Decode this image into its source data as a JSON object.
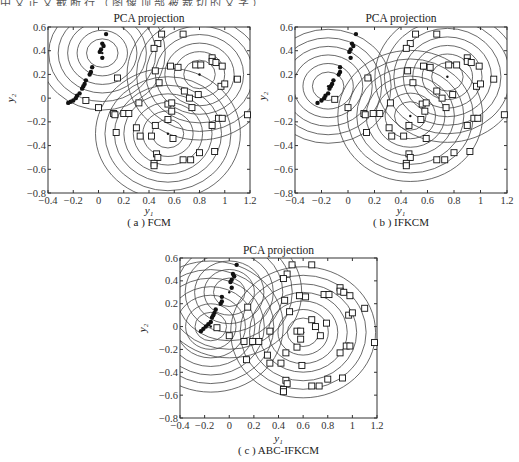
{
  "header_fragment": "中文正文截断行（图像顶部被裁切的文字）",
  "chart_data": [
    {
      "type": "scatter",
      "panel": "a",
      "title": "PCA projection",
      "caption": "( a ) FCM",
      "xlabel": "y1",
      "ylabel": "y2",
      "xlim": [
        -0.4,
        1.2
      ],
      "ylim": [
        -0.8,
        0.6
      ],
      "xticks": [
        "-0.4",
        "-0.2",
        "0",
        "0.2",
        "0.4",
        "0.6",
        "0.8",
        "1",
        "1.2"
      ],
      "yticks": [
        "0.6",
        "0.4",
        "0.2",
        "0",
        "-0.2",
        "-0.4",
        "-0.6",
        "-0.8"
      ],
      "grid": false,
      "contours": true,
      "cluster_centers": [
        [
          0.03,
          0.38
        ],
        [
          0.8,
          0.2
        ],
        [
          0.55,
          -0.3
        ]
      ],
      "series": [
        {
          "name": "class-1 (dots)",
          "marker": "filled-circle",
          "points": [
            [
              0.06,
              0.54
            ],
            [
              0.03,
              0.46
            ],
            [
              0.04,
              0.44
            ],
            [
              0.02,
              0.41
            ],
            [
              0.01,
              0.39
            ],
            [
              0.03,
              0.34
            ],
            [
              -0.05,
              0.26
            ],
            [
              -0.06,
              0.22
            ],
            [
              -0.07,
              0.2
            ],
            [
              -0.1,
              0.15
            ],
            [
              -0.11,
              0.12
            ],
            [
              -0.12,
              0.1
            ],
            [
              -0.13,
              0.08
            ],
            [
              -0.15,
              0.04
            ],
            [
              -0.17,
              0.02
            ],
            [
              -0.18,
              0.0
            ],
            [
              -0.2,
              -0.02
            ],
            [
              -0.22,
              -0.03
            ],
            [
              -0.24,
              -0.04
            ]
          ]
        },
        {
          "name": "class-2 (squares)",
          "marker": "open-square",
          "points": [
            [
              0.5,
              0.54
            ],
            [
              0.67,
              0.54
            ],
            [
              0.47,
              0.46
            ],
            [
              0.44,
              0.42
            ],
            [
              0.15,
              0.17
            ],
            [
              0.45,
              0.23
            ],
            [
              0.57,
              0.27
            ],
            [
              0.63,
              0.26
            ],
            [
              0.77,
              0.28
            ],
            [
              0.81,
              0.28
            ],
            [
              0.9,
              0.34
            ],
            [
              0.9,
              0.31
            ],
            [
              0.93,
              0.3
            ],
            [
              0.98,
              0.27
            ],
            [
              0.97,
              0.1
            ],
            [
              1.0,
              0.12
            ],
            [
              1.1,
              0.16
            ],
            [
              0.48,
              0.13
            ],
            [
              0.68,
              0.06
            ],
            [
              0.79,
              0.03
            ],
            [
              0.72,
              0.0
            ],
            [
              -0.1,
              -0.02
            ],
            [
              0.0,
              -0.08
            ],
            [
              0.32,
              -0.04
            ],
            [
              0.55,
              -0.05
            ],
            [
              0.58,
              -0.04
            ],
            [
              0.74,
              -0.08
            ],
            [
              0.12,
              -0.13
            ],
            [
              0.13,
              -0.14
            ],
            [
              0.2,
              -0.13
            ],
            [
              0.24,
              -0.13
            ],
            [
              0.58,
              -0.11
            ],
            [
              0.95,
              -0.17
            ],
            [
              0.98,
              -0.17
            ],
            [
              1.18,
              -0.14
            ],
            [
              0.55,
              -0.18
            ],
            [
              0.45,
              -0.23
            ],
            [
              0.9,
              -0.23
            ],
            [
              0.3,
              -0.25
            ],
            [
              0.14,
              -0.29
            ],
            [
              0.33,
              -0.32
            ],
            [
              0.42,
              -0.32
            ],
            [
              0.59,
              -0.34
            ],
            [
              0.8,
              -0.46
            ],
            [
              0.92,
              -0.45
            ],
            [
              0.46,
              -0.47
            ],
            [
              0.47,
              -0.5
            ],
            [
              0.67,
              -0.52
            ],
            [
              0.73,
              -0.52
            ],
            [
              0.44,
              -0.55
            ],
            [
              0.44,
              -0.57
            ]
          ]
        }
      ]
    },
    {
      "type": "scatter",
      "panel": "b",
      "title": "PCA projection",
      "caption": "( b ) IFKCM",
      "xlabel": "y1",
      "ylabel": "y2",
      "xlim": [
        -0.4,
        1.2
      ],
      "ylim": [
        -0.8,
        0.6
      ],
      "xticks": [
        "-0.4",
        "-0.2",
        "0",
        "0.2",
        "0.4",
        "0.6",
        "0.8",
        "1",
        "1.2"
      ],
      "yticks": [
        "0.6",
        "0.4",
        "0.2",
        "0",
        "-0.2",
        "-0.4",
        "-0.6",
        "-0.8"
      ],
      "grid": false,
      "contours": true,
      "cluster_centers": [
        [
          -0.15,
          0.1
        ],
        [
          0.75,
          0.18
        ],
        [
          0.47,
          -0.15
        ]
      ],
      "series": [
        {
          "name": "class-1 (dots)",
          "marker": "filled-circle",
          "points": [
            [
              0.06,
              0.54
            ],
            [
              0.03,
              0.46
            ],
            [
              0.04,
              0.44
            ],
            [
              0.02,
              0.41
            ],
            [
              0.01,
              0.39
            ],
            [
              0.02,
              0.34
            ],
            [
              -0.06,
              0.26
            ],
            [
              -0.06,
              0.22
            ],
            [
              -0.07,
              0.2
            ],
            [
              -0.11,
              0.15
            ],
            [
              -0.12,
              0.12
            ],
            [
              -0.13,
              0.1
            ],
            [
              -0.14,
              0.08
            ],
            [
              -0.15,
              0.04
            ],
            [
              -0.17,
              0.02
            ],
            [
              -0.18,
              0.0
            ],
            [
              -0.2,
              -0.02
            ],
            [
              -0.23,
              -0.04
            ]
          ]
        },
        {
          "name": "class-2 (squares)",
          "marker": "open-square",
          "points": [
            [
              0.51,
              0.54
            ],
            [
              0.67,
              0.54
            ],
            [
              0.47,
              0.46
            ],
            [
              0.44,
              0.42
            ],
            [
              0.15,
              0.17
            ],
            [
              0.45,
              0.23
            ],
            [
              0.57,
              0.27
            ],
            [
              0.62,
              0.26
            ],
            [
              0.76,
              0.28
            ],
            [
              0.82,
              0.28
            ],
            [
              0.9,
              0.34
            ],
            [
              0.9,
              0.31
            ],
            [
              0.93,
              0.3
            ],
            [
              0.99,
              0.27
            ],
            [
              0.97,
              0.1
            ],
            [
              1.0,
              0.12
            ],
            [
              1.1,
              0.16
            ],
            [
              0.49,
              0.13
            ],
            [
              0.67,
              0.06
            ],
            [
              0.79,
              0.03
            ],
            [
              0.71,
              0.0
            ],
            [
              -0.1,
              -0.01
            ],
            [
              0.0,
              -0.08
            ],
            [
              0.32,
              -0.04
            ],
            [
              0.56,
              -0.05
            ],
            [
              0.59,
              -0.04
            ],
            [
              0.74,
              -0.08
            ],
            [
              0.12,
              -0.13
            ],
            [
              0.13,
              -0.14
            ],
            [
              0.19,
              -0.13
            ],
            [
              0.24,
              -0.13
            ],
            [
              0.58,
              -0.11
            ],
            [
              0.95,
              -0.17
            ],
            [
              0.98,
              -0.17
            ],
            [
              1.18,
              -0.14
            ],
            [
              0.55,
              -0.18
            ],
            [
              0.46,
              -0.23
            ],
            [
              0.9,
              -0.23
            ],
            [
              0.31,
              -0.25
            ],
            [
              0.14,
              -0.29
            ],
            [
              0.33,
              -0.32
            ],
            [
              0.42,
              -0.32
            ],
            [
              0.59,
              -0.34
            ],
            [
              0.8,
              -0.46
            ],
            [
              0.92,
              -0.45
            ],
            [
              0.46,
              -0.47
            ],
            [
              0.47,
              -0.5
            ],
            [
              0.67,
              -0.52
            ],
            [
              0.73,
              -0.52
            ],
            [
              0.44,
              -0.55
            ],
            [
              0.44,
              -0.57
            ]
          ]
        }
      ]
    },
    {
      "type": "scatter",
      "panel": "c",
      "title": "PCA projection",
      "caption": "( c ) ABC-IFKCM",
      "xlabel": "y1",
      "ylabel": "y2",
      "xlim": [
        -0.4,
        1.2
      ],
      "ylim": [
        -0.8,
        0.6
      ],
      "xticks": [
        "-0.4",
        "-0.2",
        "0",
        "0.2",
        "0.4",
        "0.6",
        "0.8",
        "1",
        "1.2"
      ],
      "yticks": [
        "0.6",
        "0.4",
        "0.2",
        "0",
        "-0.2",
        "-0.4",
        "-0.6",
        "-0.8"
      ],
      "grid": false,
      "contours": true,
      "cluster_centers": [
        [
          -0.15,
          0.0
        ],
        [
          0.0,
          0.3
        ],
        [
          0.6,
          -0.05
        ]
      ],
      "series": [
        {
          "name": "class-1 (dots)",
          "marker": "filled-circle",
          "points": [
            [
              0.06,
              0.54
            ],
            [
              0.03,
              0.46
            ],
            [
              0.04,
              0.44
            ],
            [
              0.02,
              0.41
            ],
            [
              0.01,
              0.39
            ],
            [
              0.02,
              0.34
            ],
            [
              -0.06,
              0.26
            ],
            [
              -0.06,
              0.22
            ],
            [
              -0.07,
              0.2
            ],
            [
              -0.11,
              0.15
            ],
            [
              -0.12,
              0.12
            ],
            [
              -0.13,
              0.1
            ],
            [
              -0.14,
              0.08
            ],
            [
              -0.15,
              0.04
            ],
            [
              -0.17,
              0.02
            ],
            [
              -0.19,
              0.0
            ],
            [
              -0.21,
              -0.02
            ],
            [
              -0.23,
              -0.04
            ]
          ]
        },
        {
          "name": "class-2 (squares)",
          "marker": "open-square",
          "points": [
            [
              0.51,
              0.54
            ],
            [
              0.67,
              0.54
            ],
            [
              0.47,
              0.46
            ],
            [
              0.44,
              0.42
            ],
            [
              0.15,
              0.17
            ],
            [
              0.45,
              0.23
            ],
            [
              0.57,
              0.27
            ],
            [
              0.62,
              0.26
            ],
            [
              0.77,
              0.28
            ],
            [
              0.81,
              0.28
            ],
            [
              0.9,
              0.34
            ],
            [
              0.9,
              0.31
            ],
            [
              0.93,
              0.3
            ],
            [
              0.98,
              0.27
            ],
            [
              0.97,
              0.1
            ],
            [
              1.0,
              0.12
            ],
            [
              1.1,
              0.16
            ],
            [
              0.49,
              0.13
            ],
            [
              0.67,
              0.06
            ],
            [
              0.79,
              0.03
            ],
            [
              0.7,
              0.0
            ],
            [
              -0.1,
              -0.01
            ],
            [
              0.0,
              -0.08
            ],
            [
              0.33,
              -0.04
            ],
            [
              0.55,
              -0.04
            ],
            [
              0.58,
              -0.04
            ],
            [
              0.74,
              -0.08
            ],
            [
              0.12,
              -0.13
            ],
            [
              0.19,
              -0.13
            ],
            [
              0.24,
              -0.13
            ],
            [
              0.58,
              -0.11
            ],
            [
              0.95,
              -0.17
            ],
            [
              0.98,
              -0.17
            ],
            [
              1.18,
              -0.14
            ],
            [
              0.55,
              -0.18
            ],
            [
              0.46,
              -0.23
            ],
            [
              0.9,
              -0.23
            ],
            [
              0.31,
              -0.25
            ],
            [
              0.14,
              -0.29
            ],
            [
              0.33,
              -0.32
            ],
            [
              0.42,
              -0.32
            ],
            [
              0.59,
              -0.34
            ],
            [
              0.8,
              -0.46
            ],
            [
              0.92,
              -0.45
            ],
            [
              0.46,
              -0.47
            ],
            [
              0.47,
              -0.5
            ],
            [
              0.67,
              -0.52
            ],
            [
              0.73,
              -0.52
            ],
            [
              0.44,
              -0.55
            ],
            [
              0.44,
              -0.57
            ]
          ]
        }
      ]
    }
  ],
  "panels": [
    {
      "id": "a",
      "title": "PCA projection",
      "caption": "( a ) FCM",
      "xlabel": "y₁",
      "ylabel": "y₂"
    },
    {
      "id": "b",
      "title": "PCA projection",
      "caption": "( b ) IFKCM",
      "xlabel": "y₁",
      "ylabel": "y₂"
    },
    {
      "id": "c",
      "title": "PCA projection",
      "caption": "( c ) ABC-IFKCM",
      "xlabel": "y₁",
      "ylabel": "y₂"
    }
  ],
  "colors": {
    "axis": "#333333",
    "contour": "#444444",
    "marker": "#111111",
    "background": "#ffffff"
  }
}
